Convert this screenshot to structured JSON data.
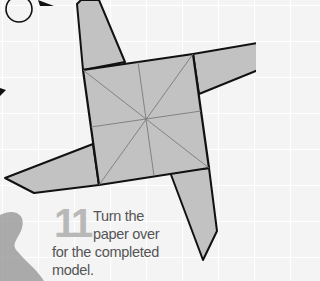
{
  "instruction": {
    "step_number": "11",
    "lines": [
      "Turn the",
      "paper over",
      "for the completed",
      "model."
    ]
  },
  "colors": {
    "paper_fill": "#c2c2c2",
    "outline": "#111111",
    "crease": "#7a7a7a",
    "step_number": "#b8b8b8",
    "text": "#555555",
    "background": "#f4f4f4"
  },
  "icons": {
    "turn_over": "rotate-arrow-icon",
    "fold_arrow": "arrowhead-icon"
  }
}
